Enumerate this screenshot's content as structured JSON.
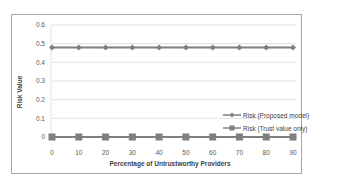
{
  "chart_data": {
    "type": "line",
    "title": "",
    "xlabel": "Percentage of Untrustworthy Providers",
    "ylabel": "Risk Value",
    "x": [
      0,
      10,
      20,
      30,
      40,
      50,
      60,
      70,
      80,
      90
    ],
    "categories": [
      "0",
      "10",
      "20",
      "30",
      "40",
      "50",
      "60",
      "70",
      "80",
      "90"
    ],
    "series": [
      {
        "name": "Risk (Proposed model)",
        "values": [
          0.48,
          0.48,
          0.48,
          0.48,
          0.48,
          0.48,
          0.48,
          0.48,
          0.48,
          0.48
        ],
        "color": "#7f7f7f",
        "marker": "diamond"
      },
      {
        "name": "Risk (Trust value only)",
        "values": [
          0,
          0,
          0,
          0,
          0,
          0,
          0,
          0,
          0,
          0
        ],
        "color": "#7f7f7f",
        "marker": "square"
      }
    ],
    "ylim": [
      0,
      0.6
    ],
    "yticks": [
      "0",
      "0.1",
      "0.2",
      "0.3",
      "0.4",
      "0.5",
      "0.6"
    ],
    "grid": true,
    "legend_position": "right-inside"
  },
  "labels": {
    "xlabel": "Percentage of Untrustworthy Providers",
    "ylabel": "Risk Value",
    "legend": [
      "Risk (Proposed model)",
      "Risk (Trust value only)"
    ]
  }
}
